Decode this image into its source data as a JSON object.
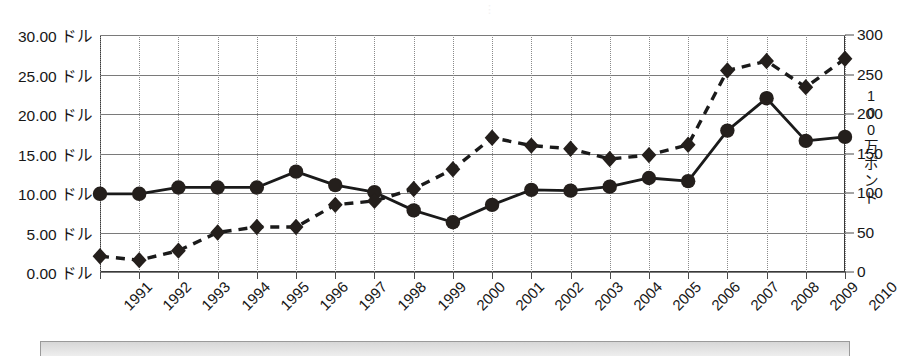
{
  "title_fragment": "︙",
  "axes": {
    "left": {
      "unit_suffix": " ドル",
      "ticks": [
        "0.00 ドル",
        "5.00 ドル",
        "10.00 ドル",
        "15.00 ドル",
        "20.00 ドル",
        "25.00 ドル",
        "30.00 ドル"
      ],
      "min": 0,
      "max": 30,
      "step": 5
    },
    "right": {
      "title": "100万ポンド",
      "title_chars": [
        "1",
        "0",
        "0",
        "万",
        "ポ",
        "ン",
        "ド"
      ],
      "ticks": [
        "0",
        "50",
        "100",
        "150",
        "200",
        "250",
        "300"
      ],
      "min": 0,
      "max": 300,
      "step": 50
    },
    "x": {
      "categories": [
        "1991",
        "1992",
        "1993",
        "1994",
        "1995",
        "1996",
        "1997",
        "1998",
        "1999",
        "2000",
        "2001",
        "2002",
        "2003",
        "2004",
        "2005",
        "2006",
        "2007",
        "2008",
        "2009",
        "2010"
      ]
    }
  },
  "colors": {
    "series_price": "#1a1a1a",
    "series_volume": "#1a1a1a",
    "gridline": "#7a7a7a",
    "vertical_gridline": "#8a8a8a",
    "plot_border": "#3a3a3a",
    "legend_fill": "#dcdcdc"
  },
  "chart_data": {
    "type": "line",
    "title": "",
    "xlabel": "",
    "ylabel": "ドル",
    "y2label": "100万ポンド",
    "grid": true,
    "legend_position": "bottom",
    "categories": [
      "1991",
      "1992",
      "1993",
      "1994",
      "1995",
      "1996",
      "1997",
      "1998",
      "1999",
      "2000",
      "2001",
      "2002",
      "2003",
      "2004",
      "2005",
      "2006",
      "2007",
      "2008",
      "2009",
      "2010"
    ],
    "ylim": [
      0,
      30
    ],
    "y2lim": [
      0,
      300
    ],
    "series": [
      {
        "name": "価格 (ドル)",
        "axis": "left",
        "marker": "circle",
        "linestyle": "solid",
        "values": [
          9.9,
          9.9,
          10.7,
          10.7,
          10.7,
          12.7,
          11.0,
          10.1,
          7.8,
          6.3,
          8.5,
          10.4,
          10.3,
          10.8,
          11.9,
          11.5,
          17.9,
          22.0,
          16.6,
          17.1
        ]
      },
      {
        "name": "数量 (100万ポンド)",
        "axis": "right",
        "marker": "diamond",
        "linestyle": "dashed",
        "values": [
          20,
          15,
          27,
          50,
          57,
          57,
          85,
          90,
          105,
          130,
          170,
          160,
          156,
          143,
          148,
          161,
          255,
          267,
          234,
          270
        ]
      }
    ]
  }
}
